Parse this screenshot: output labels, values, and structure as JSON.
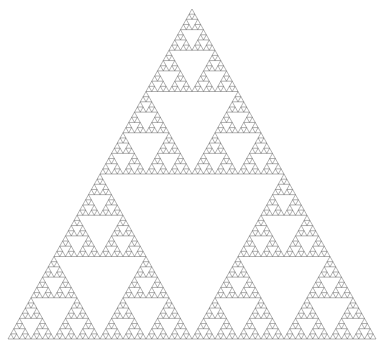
{
  "figure": {
    "title": "Sierpinski Triangle",
    "type": "fractal",
    "subtype": "sierpinski-gasket",
    "background_color": "#ffffff",
    "stroke_color": "#3c3c3c",
    "stroke_width": 0.4,
    "fill": "none",
    "canvas": {
      "width": 383,
      "height": 346
    }
  },
  "chart_data": {
    "type": "scatter",
    "title": "Sierpinski Triangle",
    "subtitle": "",
    "xlabel": "",
    "ylabel": "",
    "grid": false,
    "legend": "none",
    "axes_visible": false,
    "tick_labels_x": [],
    "tick_labels_y": [],
    "annotations": [],
    "geometry": {
      "shape": "equilateral-triangle",
      "apex": {
        "x": 192,
        "y": 9
      },
      "bottom_left": {
        "x": 8,
        "y": 339
      },
      "bottom_right": {
        "x": 376,
        "y": 339
      },
      "base_width": 368,
      "height": 330,
      "recursion_depth": 6,
      "subdivision_rule": "midpoint-removal",
      "triangles_total": 729,
      "triangles_per_base_edge": 64,
      "smallest_triangle_width": 5.75,
      "smallest_triangle_height": 5.16,
      "holes_level_1": 1,
      "holes_total": 364
    }
  }
}
